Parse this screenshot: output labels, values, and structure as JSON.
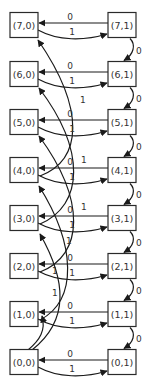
{
  "diagram": {
    "type": "state-transition-graph",
    "left_column": [
      {
        "id": "n70",
        "label": "(7,0)",
        "row": 7
      },
      {
        "id": "n60",
        "label": "(6,0)",
        "row": 6
      },
      {
        "id": "n50",
        "label": "(5,0)",
        "row": 5
      },
      {
        "id": "n40",
        "label": "(4,0)",
        "row": 4
      },
      {
        "id": "n30",
        "label": "(3,0)",
        "row": 3
      },
      {
        "id": "n20",
        "label": "(2,0)",
        "row": 2
      },
      {
        "id": "n10",
        "label": "(1,0)",
        "row": 1
      },
      {
        "id": "n00",
        "label": "(0,0)",
        "row": 0
      }
    ],
    "right_column": [
      {
        "id": "n71",
        "label": "(7,1)",
        "row": 7
      },
      {
        "id": "n61",
        "label": "(6,1)",
        "row": 6
      },
      {
        "id": "n51",
        "label": "(5,1)",
        "row": 5
      },
      {
        "id": "n41",
        "label": "(4,1)",
        "row": 4
      },
      {
        "id": "n31",
        "label": "(3,1)",
        "row": 3
      },
      {
        "id": "n21",
        "label": "(2,1)",
        "row": 2
      },
      {
        "id": "n11",
        "label": "(1,1)",
        "row": 1
      },
      {
        "id": "n01",
        "label": "(0,1)",
        "row": 1
      }
    ],
    "horizontal_edges": {
      "right_to_left_label": "0",
      "left_to_right_label": "1"
    },
    "vertical_edge_label": "0",
    "long_edge_label": "1",
    "long_edges": [
      {
        "from": "(4,0)",
        "to": "(7,0)",
        "label": "1"
      },
      {
        "from": "(3,0)",
        "to": "(6,0)",
        "label": "1"
      },
      {
        "from": "(2,0)",
        "to": "(5,0)",
        "label": "1"
      },
      {
        "from": "(1,0)",
        "to": "(4,0)",
        "label": "1"
      },
      {
        "from": "(0,0)",
        "to": "(3,0)",
        "label": "1"
      },
      {
        "from": "(0,0)",
        "to": "(1,0)",
        "label": "1"
      }
    ]
  }
}
